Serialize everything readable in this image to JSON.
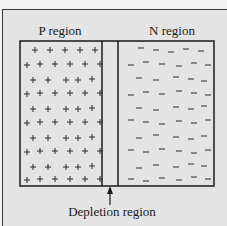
{
  "diagram": {
    "labels": {
      "p_region": "P region",
      "n_region": "N region",
      "depletion_region": "Depletion region"
    },
    "symbols": {
      "p_carrier": "+",
      "n_carrier": "−"
    },
    "colors": {
      "background": "#e4e4e4",
      "stroke": "#1a1a1a",
      "text": "#1a1a1a"
    },
    "regions": [
      {
        "name": "P region",
        "carrier": "+",
        "x": [
          20,
          102
        ]
      },
      {
        "name": "Depletion region",
        "carrier": "none",
        "x": [
          102,
          118
        ]
      },
      {
        "name": "N region",
        "carrier": "−",
        "x": [
          118,
          214
        ]
      }
    ]
  }
}
